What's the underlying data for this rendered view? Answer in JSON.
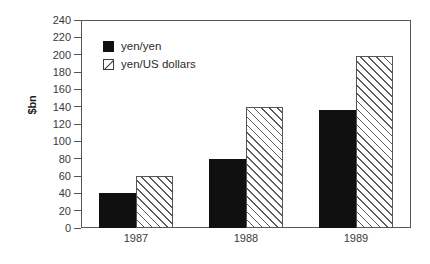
{
  "chart_data": {
    "type": "bar",
    "title": "",
    "xlabel": "",
    "ylabel": "$bn",
    "categories": [
      "1987",
      "1988",
      "1989"
    ],
    "series": [
      {
        "name": "yen/yen",
        "values": [
          40,
          80,
          136
        ],
        "style": "solid-black",
        "color": "#101010"
      },
      {
        "name": "yen/US dollars",
        "values": [
          60,
          140,
          198
        ],
        "style": "diagonal-hatch",
        "color": "#55565a"
      }
    ],
    "ylim": [
      0,
      240
    ],
    "ytick_step": 20,
    "yticks": [
      240,
      220,
      200,
      180,
      160,
      140,
      120,
      100,
      80,
      60,
      40,
      20,
      0
    ],
    "grid": false,
    "legend_position": "top-left-inside",
    "frame": true
  },
  "axes": {
    "y_title": "$bn"
  },
  "legend": {
    "entries": [
      {
        "label": "yen/yen",
        "swatch": "solid-square-icon"
      },
      {
        "label": "yen/US dollars",
        "swatch": "hatched-square-icon"
      }
    ]
  },
  "colors": {
    "background": "#ffffff",
    "axis": "#55565a",
    "text": "#3a3a3c",
    "series_solid": "#101010",
    "series_hatch": "#5a5b5f"
  }
}
